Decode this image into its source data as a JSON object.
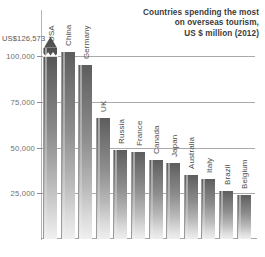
{
  "title": {
    "line1": "Countries spending the most",
    "line2": "on overseas tourism,",
    "line3": "US $ million (2012)"
  },
  "axis": {
    "tick_labels": [
      "25,000",
      "50,000",
      "75,000",
      "100,000"
    ],
    "callout_label": "US$126,573"
  },
  "chart_data": {
    "type": "bar",
    "title": "Countries spending the most on overseas tourism, US $ million (2012)",
    "xlabel": "",
    "ylabel": "US $ million",
    "ylim": [
      0,
      110000
    ],
    "yticks": [
      25000,
      50000,
      75000,
      100000
    ],
    "ytick_labels": [
      "25,000",
      "50,000",
      "75,000",
      "100,000"
    ],
    "grid": true,
    "legend": "none",
    "axis_break": true,
    "annotations": [
      "US$126,573"
    ],
    "categories": [
      "USA",
      "China",
      "Germany",
      "UK",
      "Russia",
      "France",
      "Canada",
      "Japan",
      "Australia",
      "Italy",
      "Brazil",
      "Belgium"
    ],
    "values": [
      126573,
      102000,
      95000,
      66000,
      48500,
      47500,
      43000,
      41500,
      35000,
      33000,
      26000,
      24000
    ]
  }
}
